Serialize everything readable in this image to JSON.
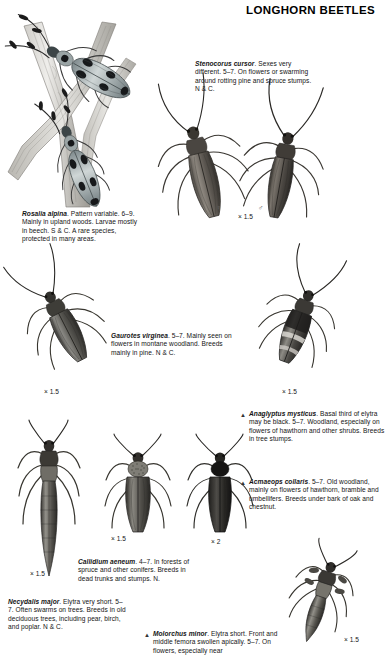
{
  "header": {
    "title": "LONGHORN BEETLES"
  },
  "species": [
    {
      "id": "rosalia-alpina",
      "name": "Rosalia alpina",
      "text": ". Pattern variable. 6–9. Mainly in upland woods. Larvae mostly in beech. S & C. A rare species, protected in many areas.",
      "marker": "",
      "scale": ""
    },
    {
      "id": "stenocorus-cursor",
      "name": "Stenocorus cursor",
      "text": ". Sexes very different. 5–7. On flowers or swarming around rotting pine and spruce stumps. N & C.",
      "marker": "",
      "scale": "× 1.5"
    },
    {
      "id": "gaurotes-virginea",
      "name": "Gaurotes virginea",
      "text": ". 5–7. Mainly seen on flowers in montane woodland. Breeds mainly in pine. N & C.",
      "marker": "",
      "scale": "× 1.5"
    },
    {
      "id": "anaglyptus-mysticus",
      "name": "Anaglyptus mysticus",
      "text": ". Basal third of elytra may be black. 5–7. Woodland, especially on flowers of hawthorn and other shrubs. Breeds in tree stumps.",
      "marker": "▲",
      "scale": "× 1.5"
    },
    {
      "id": "acmaeops-collaris",
      "name": "Acmaeops collaris",
      "text": ". 5–7. Old woodland, mainly on flowers of hawthorn, bramble and umbellifers. Breeds under bark of oak and chestnut.",
      "marker": "▲",
      "scale": ""
    },
    {
      "id": "callidium-aeneum",
      "name": "Callidium aeneum",
      "text": ". 4–7. In forests of spruce and other conifers. Breeds in dead trunks and stumps. N.",
      "marker": "",
      "scale": "× 1.5"
    },
    {
      "id": "necydalis-major",
      "name": "Necydalis major",
      "text": ". Elytra very short. 5–7. Often swarms on trees. Breeds in old deciduous trees, including pear, birch, and poplar. N & C.",
      "marker": "",
      "scale": "× 1.5"
    },
    {
      "id": "molorchus-minor",
      "name": "Molorchus minor",
      "text": ". Elytra short. Front and middle femora swollen apically. 5–7. On flowers, especially near",
      "marker": "▲",
      "scale": "× 1.5"
    }
  ],
  "scale_labels": {
    "stenocorus": "× 1.5",
    "gaurotes": "× 1.5",
    "anaglyptus": "× 1.5",
    "necydalis": "× 1.5",
    "callidium": "× 1.5",
    "acmaeops_pair": "× 2",
    "molorchus": "× 1.5"
  },
  "sex_symbols": {
    "female": "♀",
    "male": "♂"
  },
  "colors": {
    "ink": "#141414",
    "paper": "#ffffff",
    "muted": "#6e6e6e"
  }
}
